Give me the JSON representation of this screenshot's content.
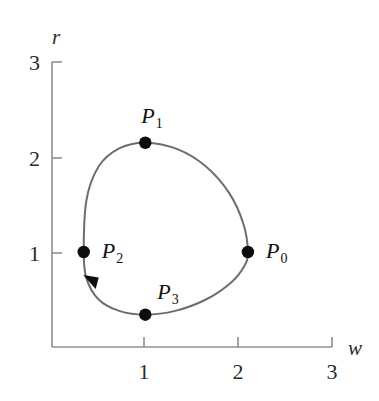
{
  "figure": {
    "title": "",
    "background_color": "#ffffff",
    "axis_color": "#8a8a8a",
    "curve_color": "#6d6d6d",
    "marker_color": "#0d0d0d",
    "text_color": "#1f1f1f"
  },
  "axes": {
    "x": {
      "name": "w",
      "ticks": [
        "1",
        "2",
        "3"
      ],
      "tick_values": [
        1,
        2,
        3
      ],
      "range": [
        0,
        3
      ]
    },
    "y": {
      "name": "r",
      "ticks": [
        "1",
        "2",
        "3"
      ],
      "tick_values": [
        1,
        2,
        3
      ],
      "range": [
        0,
        3
      ]
    }
  },
  "chart_data": {
    "type": "line",
    "title": "",
    "xlabel": "w",
    "ylabel": "r",
    "xlim": [
      0,
      3
    ],
    "ylim": [
      0,
      3
    ],
    "grid": false,
    "legend": "none",
    "closed_curve": true,
    "direction": "counterclockwise",
    "series": [
      {
        "name": "closed-orbit",
        "x": [
          2.1,
          2.05,
          1.9,
          1.65,
          1.35,
          1.0,
          0.72,
          0.5,
          0.37,
          0.34,
          0.37,
          0.5,
          0.72,
          1.0,
          1.32,
          1.65,
          1.92,
          2.06,
          2.1
        ],
        "y": [
          1.0,
          1.3,
          1.62,
          1.9,
          2.08,
          2.15,
          2.09,
          1.9,
          1.55,
          1.0,
          0.72,
          0.5,
          0.38,
          0.34,
          0.38,
          0.5,
          0.68,
          0.85,
          1.0
        ]
      }
    ],
    "points": [
      {
        "id": "P0",
        "label": "P",
        "subscript": "0",
        "x": 2.1,
        "y": 1.0,
        "label_position": "right"
      },
      {
        "id": "P1",
        "label": "P",
        "subscript": "1",
        "x": 1.0,
        "y": 2.15,
        "label_position": "above"
      },
      {
        "id": "P2",
        "label": "P",
        "subscript": "2",
        "x": 0.34,
        "y": 1.0,
        "label_position": "right"
      },
      {
        "id": "P3",
        "label": "P",
        "subscript": "3",
        "x": 1.0,
        "y": 0.34,
        "label_position": "above-right"
      }
    ],
    "annotations": [
      {
        "type": "arrowhead",
        "x": 0.42,
        "y": 0.7,
        "direction": "counterclockwise-down-left"
      }
    ]
  }
}
